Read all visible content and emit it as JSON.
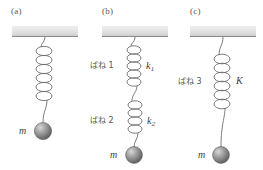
{
  "figure": {
    "background_color": "#ffffff",
    "ink_color": "#4a4a4a",
    "ceiling_color": "#e2e2e2",
    "mass_color": "#8f8f8f"
  },
  "panels": [
    {
      "id": "a",
      "caption": "(a)",
      "mass_label": "m",
      "springs": [
        {
          "name_label": "",
          "constant_label": "",
          "coils": 6
        }
      ]
    },
    {
      "id": "b",
      "caption": "(b)",
      "mass_label": "m",
      "springs": [
        {
          "name_label": "ばね 1",
          "constant_label": "k",
          "constant_sub": "1",
          "coils": 5
        },
        {
          "name_label": "ばね 2",
          "constant_label": "k",
          "constant_sub": "2",
          "coils": 5
        }
      ]
    },
    {
      "id": "c",
      "caption": "(c)",
      "mass_label": "m",
      "springs": [
        {
          "name_label": "ばね 3",
          "constant_label": "K",
          "constant_sub": "",
          "coils": 6
        }
      ]
    }
  ]
}
